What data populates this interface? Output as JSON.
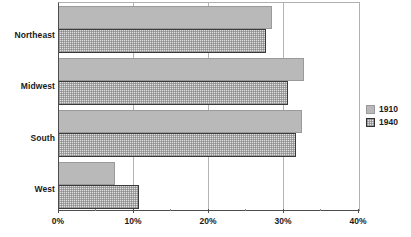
{
  "chart_data": {
    "type": "bar",
    "orientation": "horizontal",
    "title": "",
    "xlabel": "",
    "ylabel": "",
    "categories": [
      "Northeast",
      "Midwest",
      "South",
      "West"
    ],
    "series": [
      {
        "name": "1910",
        "values": [
          28.4,
          32.7,
          32.4,
          7.5
        ],
        "color": "#b9b9b9"
      },
      {
        "name": "1940",
        "values": [
          27.6,
          30.5,
          31.6,
          10.6
        ],
        "color": "#dedede"
      }
    ],
    "xlim": [
      0,
      40
    ],
    "xtick_labels": [
      "0%",
      "10%",
      "20%",
      "30%",
      "40%"
    ],
    "xtick_values": [
      0,
      10,
      20,
      30,
      40
    ],
    "xminor_tick_values": [
      5,
      15,
      25,
      35
    ],
    "grid": true,
    "grid_axis": "x",
    "legend": [
      "1910",
      "1940"
    ],
    "legend_position": "right"
  },
  "legend": {
    "entries": [
      {
        "label": "1910",
        "swatch": "legend-swatch-1910"
      },
      {
        "label": "1940",
        "swatch": "legend-swatch-1940"
      }
    ]
  }
}
